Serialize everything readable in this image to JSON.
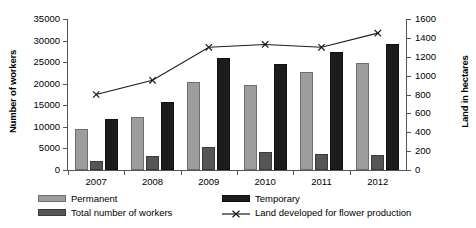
{
  "chart_data": {
    "type": "bar",
    "title": "",
    "categories": [
      "2007",
      "2008",
      "2009",
      "2010",
      "2011",
      "2012"
    ],
    "series": [
      {
        "name": "Permanent",
        "values": [
          9500,
          12200,
          20300,
          19700,
          22700,
          24700
        ],
        "axis": "left",
        "color": "#9d9d9d"
      },
      {
        "name": "Total number of workers",
        "values": [
          2100,
          3300,
          5400,
          4200,
          3800,
          3500
        ],
        "axis": "left",
        "color": "#555555"
      },
      {
        "name": "Temporary",
        "values": [
          11800,
          15700,
          26000,
          24600,
          27400,
          29100
        ],
        "axis": "left",
        "color": "#1c1c1c"
      },
      {
        "name": "Land developed for flower production",
        "values": [
          800,
          950,
          1300,
          1330,
          1300,
          1450
        ],
        "axis": "right",
        "color": "#1c1c1c",
        "marker": "x"
      }
    ],
    "xlabel": "",
    "ylabel": "Number of workers",
    "y2label": "Land in hectares",
    "ylim": [
      0,
      35000
    ],
    "y2lim": [
      0,
      1600
    ],
    "yticks": [
      "0",
      "5000",
      "10000",
      "15000",
      "20000",
      "25000",
      "30000",
      "35000"
    ],
    "y2ticks": [
      "0",
      "200",
      "400",
      "600",
      "800",
      "1000",
      "1200",
      "1400",
      "1600"
    ],
    "grid": false,
    "legend_position": "bottom"
  },
  "axes": {
    "left_title": "Number of workers",
    "right_title": "Land in hectares"
  },
  "legend": {
    "permanent": "Permanent",
    "temporary": "Temporary",
    "total": "Total number of workers",
    "land": "Land developed for flower production"
  }
}
